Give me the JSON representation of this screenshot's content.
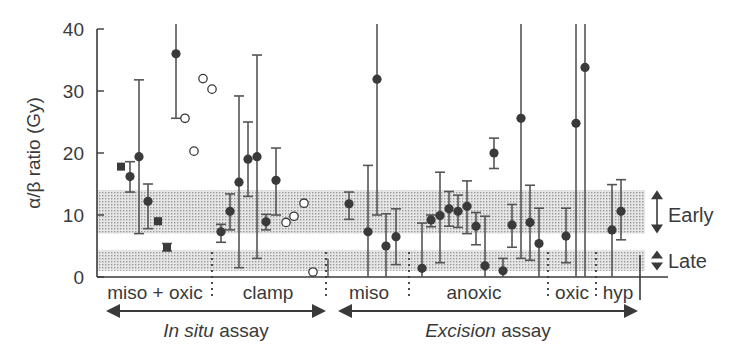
{
  "chart_data": {
    "type": "scatter",
    "title": "",
    "xlabel": "",
    "ylabel": "α/β ratio (Gy)",
    "ylim": [
      0,
      40
    ],
    "yticks": [
      0,
      10,
      20,
      30,
      40
    ],
    "grid": false,
    "bands": [
      {
        "name": "Early",
        "from": 7.0,
        "to": 14.0
      },
      {
        "name": "Late",
        "from": 1.0,
        "to": 4.3
      }
    ],
    "groups": [
      {
        "label": "miso + oxic",
        "assay": "In situ assay",
        "x_start": 97,
        "x_end": 212
      },
      {
        "label": "clamp",
        "assay": "In situ assay",
        "x_start": 212,
        "x_end": 326
      },
      {
        "label": "miso",
        "assay": "Excision assay",
        "x_start": 334,
        "x_end": 409
      },
      {
        "label": "anoxic",
        "assay": "Excision assay",
        "x_start": 409,
        "x_end": 548
      },
      {
        "label": "oxic",
        "assay": "Excision assay",
        "x_start": 548,
        "x_end": 596
      },
      {
        "label": "hyp",
        "assay": "Excision assay",
        "x_start": 596,
        "x_end": 640
      }
    ],
    "assays": [
      {
        "label_italic": "In situ",
        "label_rest": " assay",
        "x_start": 97,
        "x_end": 328
      },
      {
        "label_italic": "Excision",
        "label_rest": " assay",
        "x_start": 334,
        "x_end": 640
      }
    ],
    "points": [
      {
        "x": 121,
        "y": 17.8,
        "marker": "square",
        "group": "miso + oxic"
      },
      {
        "x": 130,
        "y": 16.2,
        "lo": 13.7,
        "hi": 18.6,
        "marker": "filled",
        "group": "miso + oxic"
      },
      {
        "x": 139,
        "y": 19.4,
        "lo": 7.0,
        "hi": 31.8,
        "marker": "filled",
        "group": "miso + oxic"
      },
      {
        "x": 148,
        "y": 12.2,
        "lo": 7.8,
        "hi": 15.0,
        "marker": "filled",
        "group": "miso + oxic"
      },
      {
        "x": 158,
        "y": 9.0,
        "marker": "square",
        "group": "miso + oxic"
      },
      {
        "x": 167,
        "y": 4.8,
        "lo": 4.2,
        "hi": 5.4,
        "marker": "square",
        "group": "miso + oxic"
      },
      {
        "x": 176,
        "y": 36.0,
        "lo": 25.6,
        "hi": 41,
        "marker": "filled",
        "group": "miso + oxic"
      },
      {
        "x": 185,
        "y": 25.6,
        "marker": "open",
        "group": "miso + oxic"
      },
      {
        "x": 194,
        "y": 20.3,
        "marker": "open",
        "group": "miso + oxic"
      },
      {
        "x": 203,
        "y": 32.0,
        "marker": "open",
        "group": "miso + oxic"
      },
      {
        "x": 212,
        "y": 30.3,
        "marker": "open",
        "group": "miso + oxic"
      },
      {
        "x": 221,
        "y": 7.3,
        "lo": 5.6,
        "hi": 8.5,
        "marker": "filled",
        "group": "clamp"
      },
      {
        "x": 230,
        "y": 10.6,
        "lo": 7.6,
        "hi": 13.4,
        "marker": "filled",
        "group": "clamp"
      },
      {
        "x": 239,
        "y": 15.3,
        "lo": 1.5,
        "hi": 29.2,
        "marker": "filled",
        "group": "clamp"
      },
      {
        "x": 248,
        "y": 19.0,
        "lo": 13.0,
        "hi": 25.0,
        "marker": "filled",
        "group": "clamp"
      },
      {
        "x": 257,
        "y": 19.4,
        "lo": 3.0,
        "hi": 35.8,
        "marker": "filled",
        "group": "clamp"
      },
      {
        "x": 266,
        "y": 8.9,
        "lo": 7.6,
        "hi": 10.1,
        "marker": "filled",
        "group": "clamp"
      },
      {
        "x": 276,
        "y": 15.6,
        "lo": 10.0,
        "hi": 20.8,
        "marker": "filled",
        "group": "clamp"
      },
      {
        "x": 286,
        "y": 8.8,
        "marker": "open",
        "group": "clamp"
      },
      {
        "x": 294,
        "y": 9.8,
        "marker": "open",
        "group": "clamp"
      },
      {
        "x": 304,
        "y": 11.9,
        "marker": "open",
        "group": "clamp"
      },
      {
        "x": 313,
        "y": 0.8,
        "marker": "open",
        "group": "clamp"
      },
      {
        "x": 349,
        "y": 11.8,
        "lo": 9.3,
        "hi": 13.7,
        "marker": "filled",
        "group": "miso"
      },
      {
        "x": 368,
        "y": 7.3,
        "lo": 0,
        "hi": 18.0,
        "marker": "filled",
        "group": "miso"
      },
      {
        "x": 377,
        "y": 31.9,
        "lo": 10.0,
        "hi": 41,
        "marker": "filled",
        "group": "miso"
      },
      {
        "x": 386,
        "y": 5.0,
        "lo": 0,
        "hi": 10.2,
        "marker": "filled",
        "group": "miso"
      },
      {
        "x": 396,
        "y": 6.5,
        "lo": 2.0,
        "hi": 11.0,
        "marker": "filled",
        "group": "miso"
      },
      {
        "x": 422,
        "y": 1.4,
        "lo": 0,
        "hi": 8.7,
        "marker": "filled",
        "group": "anoxic"
      },
      {
        "x": 431,
        "y": 9.2,
        "lo": 8.1,
        "hi": 10.0,
        "marker": "filled",
        "group": "anoxic"
      },
      {
        "x": 440,
        "y": 9.9,
        "lo": 2.3,
        "hi": 16.9,
        "marker": "filled",
        "group": "anoxic"
      },
      {
        "x": 449,
        "y": 11.0,
        "lo": 8.2,
        "hi": 13.8,
        "marker": "filled",
        "group": "anoxic"
      },
      {
        "x": 458,
        "y": 10.6,
        "lo": 8.0,
        "hi": 13.2,
        "marker": "filled",
        "group": "anoxic"
      },
      {
        "x": 467,
        "y": 11.4,
        "lo": 7.0,
        "hi": 15.5,
        "marker": "filled",
        "group": "anoxic"
      },
      {
        "x": 476,
        "y": 8.2,
        "lo": 5.2,
        "hi": 10.4,
        "marker": "filled",
        "group": "anoxic"
      },
      {
        "x": 485,
        "y": 1.8,
        "lo": 0,
        "hi": 9.8,
        "marker": "filled",
        "group": "anoxic"
      },
      {
        "x": 494,
        "y": 20.0,
        "lo": 17.5,
        "hi": 22.4,
        "marker": "filled",
        "group": "anoxic"
      },
      {
        "x": 503,
        "y": 1.0,
        "lo": 0,
        "hi": 3.0,
        "marker": "filled",
        "group": "anoxic"
      },
      {
        "x": 512,
        "y": 8.4,
        "lo": 4.8,
        "hi": 11.7,
        "marker": "filled",
        "group": "anoxic"
      },
      {
        "x": 521,
        "y": 25.6,
        "lo": 3.0,
        "hi": 41,
        "marker": "filled",
        "group": "anoxic"
      },
      {
        "x": 530,
        "y": 8.8,
        "lo": 2.7,
        "hi": 14.8,
        "marker": "filled",
        "group": "anoxic"
      },
      {
        "x": 539,
        "y": 5.4,
        "lo": 0,
        "hi": 11.1,
        "marker": "filled",
        "group": "anoxic"
      },
      {
        "x": 566,
        "y": 6.6,
        "lo": 2.3,
        "hi": 11.1,
        "marker": "filled",
        "group": "oxic"
      },
      {
        "x": 576,
        "y": 24.8,
        "lo": 0,
        "hi": 41,
        "marker": "filled",
        "group": "oxic"
      },
      {
        "x": 585,
        "y": 33.8,
        "lo": 0,
        "hi": 41,
        "marker": "filled",
        "group": "oxic"
      },
      {
        "x": 612,
        "y": 7.6,
        "lo": 0,
        "hi": 14.9,
        "marker": "filled",
        "group": "hyp"
      },
      {
        "x": 621,
        "y": 10.6,
        "lo": 6.0,
        "hi": 15.7,
        "marker": "filled",
        "group": "hyp"
      }
    ],
    "colors": {
      "ink": "#3a3a3a",
      "band": "#d6d6d6",
      "line": "#555555"
    }
  }
}
